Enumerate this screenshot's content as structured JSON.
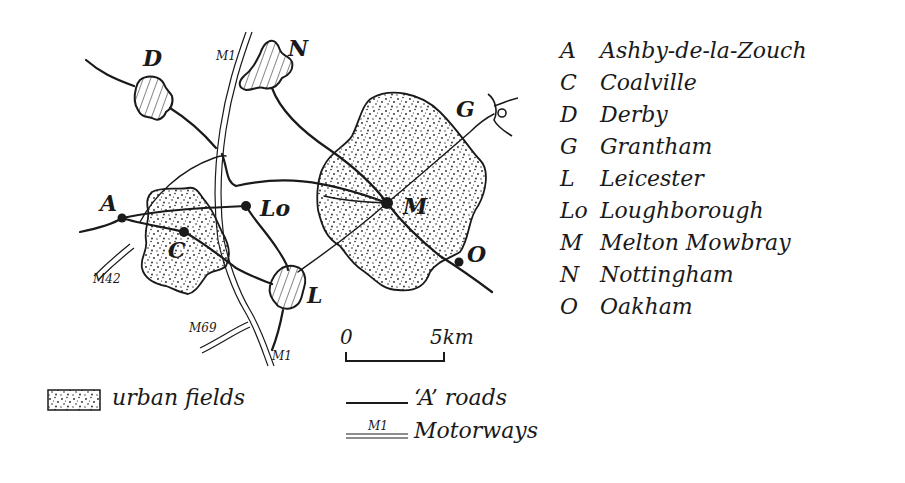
{
  "map": {
    "places": [
      {
        "code": "D",
        "label_x": 143,
        "label_y": 66
      },
      {
        "code": "N",
        "label_x": 288,
        "label_y": 56
      },
      {
        "code": "G",
        "label_x": 456,
        "label_y": 117
      },
      {
        "code": "A",
        "label_x": 100,
        "label_y": 211
      },
      {
        "code": "C",
        "label_x": 168,
        "label_y": 258
      },
      {
        "code": "Lo",
        "label_x": 260,
        "label_y": 216
      },
      {
        "code": "M",
        "label_x": 403,
        "label_y": 214
      },
      {
        "code": "O",
        "label_x": 467,
        "label_y": 262
      },
      {
        "code": "L",
        "label_x": 307,
        "label_y": 303
      }
    ],
    "motorway_labels": [
      {
        "label": "M1",
        "x": 216,
        "y": 60
      },
      {
        "label": "M42",
        "x": 93,
        "y": 283
      },
      {
        "label": "M69",
        "x": 189,
        "y": 332
      },
      {
        "label": "M1",
        "x": 272,
        "y": 360
      }
    ]
  },
  "key": {
    "items": [
      {
        "code": "A",
        "name": "Ashby-de-la-Zouch"
      },
      {
        "code": "C",
        "name": "Coalville"
      },
      {
        "code": "D",
        "name": "Derby"
      },
      {
        "code": "G",
        "name": "Grantham"
      },
      {
        "code": "L",
        "name": "Leicester"
      },
      {
        "code": "Lo",
        "name": "Loughborough"
      },
      {
        "code": "M",
        "name": "Melton Mowbray"
      },
      {
        "code": "N",
        "name": "Nottingham"
      },
      {
        "code": "O",
        "name": "Oakham"
      }
    ]
  },
  "scale": {
    "start_label": "0",
    "end_label": "5km"
  },
  "legend": {
    "urban_fields": "urban fields",
    "a_roads": "‘A’ roads",
    "motorways": "Motorways",
    "motorway_sample_label": "M1"
  },
  "colors": {
    "ink": "#1a1a1a",
    "paper": "#ffffff"
  }
}
